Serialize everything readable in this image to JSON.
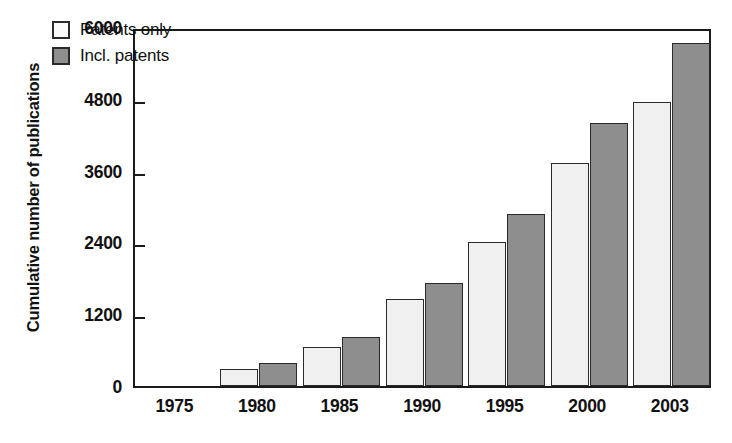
{
  "chart_data": {
    "type": "bar",
    "title": "",
    "xlabel": "",
    "ylabel": "Cumulative number of publications",
    "categories": [
      "1975",
      "1980",
      "1985",
      "1990",
      "1995",
      "2000",
      "2003"
    ],
    "series": [
      {
        "name": "Patents only",
        "values": [
          0,
          280,
          660,
          1460,
          2400,
          3720,
          4750
        ]
      },
      {
        "name": "Incl. patents",
        "values": [
          0,
          390,
          820,
          1720,
          2880,
          4400,
          5740
        ]
      }
    ],
    "ylim": [
      0,
      6000
    ],
    "yticks": [
      "0",
      "1200",
      "2400",
      "3600",
      "4800",
      "6000"
    ],
    "ytick_values": [
      0,
      1200,
      2400,
      3600,
      4800,
      6000
    ],
    "grid": false,
    "legend_position": "top-left",
    "colors": {
      "patents_only": "#f0f0f0",
      "incl_patents": "#8e8e8e",
      "axis": "#1a1a1a",
      "bar_outline": "#2a2a2a",
      "text": "#111111"
    }
  },
  "legend": {
    "items": [
      {
        "label": "Patents only",
        "swatch": "light"
      },
      {
        "label": "Incl. patents",
        "swatch": "dark"
      }
    ]
  },
  "axes": {
    "y_title": "Cumulative number of publications",
    "y_ticks": [
      "6000",
      "4800",
      "3600",
      "2400",
      "1200",
      "0"
    ],
    "x_ticks": [
      "1975",
      "1980",
      "1985",
      "1990",
      "1995",
      "2000",
      "2003"
    ]
  }
}
